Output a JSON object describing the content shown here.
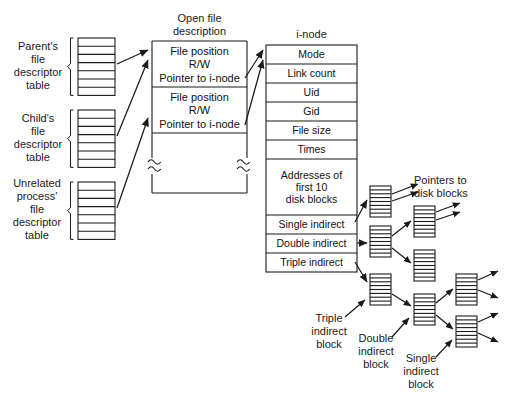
{
  "diagram": {
    "headers": {
      "open_file_description": "Open file\ndescription",
      "inode": "i-node"
    },
    "left_labels": [
      {
        "id": "parent",
        "text": "Parent's\nfile\ndescriptor\ntable",
        "rows": 7
      },
      {
        "id": "child",
        "text": "Child's\nfile\ndescriptor\ntable",
        "rows": 7
      },
      {
        "id": "unrelated",
        "text": "Unrelated\nprocess'\nfile\ndescriptor\ntable",
        "rows": 7
      }
    ],
    "open_file_entries": [
      {
        "line1": "File position",
        "line2": "R/W",
        "line3": "Pointer to i-node"
      },
      {
        "line1": "File position",
        "line2": "R/W",
        "line3": "Pointer to i-node"
      }
    ],
    "inode_fields": [
      "Mode",
      "Link count",
      "Uid",
      "Gid",
      "File size",
      "Times",
      "Addresses of\nfirst 10\ndisk blocks",
      "Single indirect",
      "Double indirect",
      "Triple indirect"
    ],
    "right_labels": [
      {
        "id": "pointers-to-disk-blocks",
        "text": "Pointers to\ndisk blocks"
      },
      {
        "id": "triple-indirect-block",
        "text": "Triple\nindirect\nblock"
      },
      {
        "id": "double-indirect-block",
        "text": "Double\nindirect\nblock"
      },
      {
        "id": "single-indirect-block",
        "text": "Single\nindirect\nblock"
      }
    ],
    "colors": {
      "stroke": "#1a1a1a",
      "text": "#111111",
      "background": "#ffffff",
      "block_fill": "#ffffff"
    },
    "block_stripes": 8
  }
}
